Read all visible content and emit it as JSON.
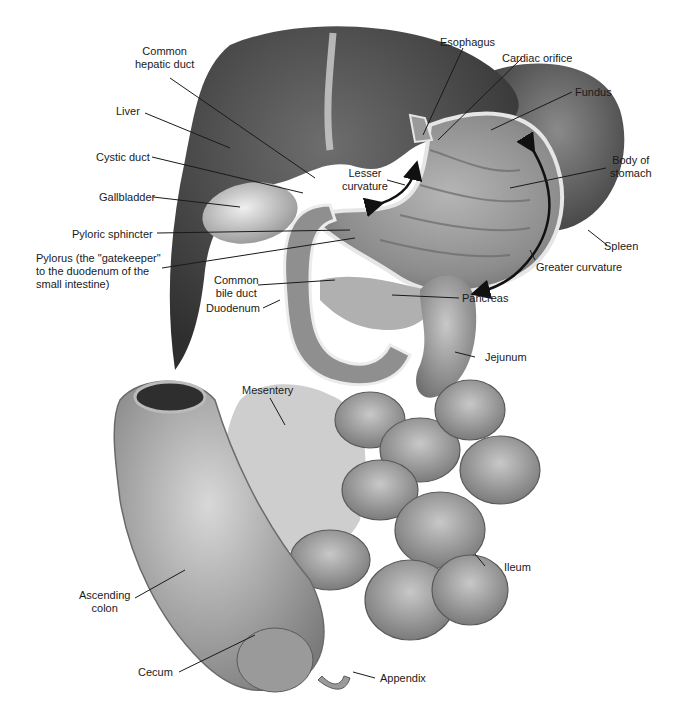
{
  "figure": {
    "type": "anatomical-illustration",
    "colors": {
      "background": "#ffffff",
      "tissue_dark": "#3a3a3a",
      "tissue_mid": "#8a8a8a",
      "tissue_light": "#cfcfcf",
      "leader": "#1a1a1a"
    }
  },
  "labels": {
    "common_hepatic_duct": "Common\nhepatic duct",
    "liver": "Liver",
    "cystic_duct": "Cystic duct",
    "gallbladder": "Gallbladder",
    "pyloric_sphincter": "Pyloric sphincter",
    "pylorus": "Pylorus (the \"gatekeeper\"\nto the duodenum of the\nsmall intestine)",
    "common_bile_duct": "Common\nbile duct",
    "duodenum": "Duodenum",
    "esophagus": "Esophagus",
    "cardiac_orifice": "Cardiac orifice",
    "fundus": "Fundus",
    "lesser_curvature": "Lesser\ncurvature",
    "body_of_stomach": "Body of\nstomach",
    "spleen": "Spleen",
    "greater_curvature": "Greater curvature",
    "pancreas": "Pancreas",
    "jejunum": "Jejunum",
    "mesentery": "Mesentery",
    "ileum": "Ileum",
    "ascending_colon": "Ascending\ncolon",
    "cecum": "Cecum",
    "appendix": "Appendix"
  }
}
